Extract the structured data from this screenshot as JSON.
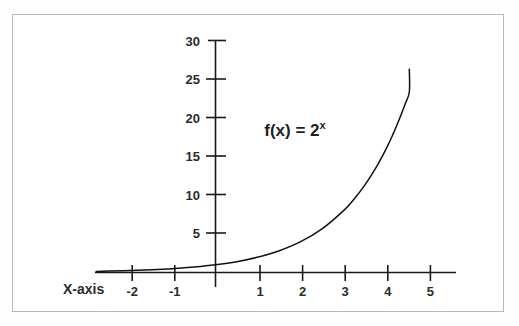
{
  "chart_data": {
    "type": "line",
    "title": "",
    "annotation": "f(x) = 2",
    "annotation_exponent": "x",
    "function": "f(x) = 2^x",
    "xlabel": "X-axis",
    "ylabel": "",
    "xlim": [
      -2.8,
      5.7
    ],
    "ylim": [
      0,
      31
    ],
    "grid": false,
    "legend": false,
    "x_ticks": [
      -2,
      -1,
      1,
      2,
      3,
      4,
      5
    ],
    "x_tick_labels": [
      "-2",
      "-1",
      "1",
      "2",
      "3",
      "4",
      "5"
    ],
    "y_ticks": [
      5,
      10,
      15,
      20,
      25,
      30
    ],
    "y_tick_labels": [
      "5",
      "10",
      "15",
      "20",
      "25",
      "30"
    ],
    "series": [
      {
        "name": "f(x) = 2^x",
        "x": [
          -2.8,
          -2.5,
          -2.0,
          -1.5,
          -1.0,
          -0.5,
          0.0,
          0.5,
          1.0,
          1.5,
          2.0,
          2.5,
          3.0,
          3.25,
          3.5,
          3.75,
          4.0,
          4.15,
          4.3,
          4.45,
          4.55
        ],
        "values": [
          0.14,
          0.18,
          0.25,
          0.35,
          0.5,
          0.71,
          1.0,
          1.41,
          2.0,
          2.83,
          4.0,
          5.66,
          8.0,
          9.51,
          11.31,
          13.45,
          16.0,
          17.75,
          19.7,
          21.86,
          23.44
        ]
      }
    ],
    "curve_endpoint": {
      "x": 4.55,
      "y": 26.4
    },
    "colors": {
      "curve": "#121212",
      "axis": "#1a1a1a",
      "text": "#2b2b2b",
      "frame": "#b8b8b8",
      "background": "#ffffff"
    }
  },
  "figure": {
    "caption": "",
    "x_axis_name": "X-axis"
  }
}
